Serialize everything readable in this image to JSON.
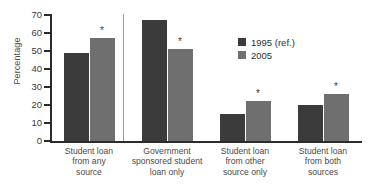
{
  "chart_data": {
    "type": "bar",
    "title": "",
    "xlabel": "",
    "ylabel": "Percentage",
    "ylim": [
      0,
      70
    ],
    "ytick_step": 10,
    "yticks": [
      70,
      60,
      50,
      40,
      30,
      20,
      10,
      0
    ],
    "grid": false,
    "legend_position": "top-right",
    "categories": [
      "Student loan from any source",
      "Government sponsored student loan only",
      "Student loan from other source only",
      "Student loan from both sources"
    ],
    "category_lines": [
      [
        "Student loan",
        "from any",
        "source"
      ],
      [
        "Government",
        "sponsored student",
        "loan only"
      ],
      [
        "Student loan",
        "from other",
        "source only"
      ],
      [
        "Student loan",
        "from both",
        "sources"
      ]
    ],
    "series": [
      {
        "name": "1995 (ref.)",
        "color": "#3b3b3b",
        "values": [
          49,
          67,
          15,
          20
        ],
        "significance": [
          false,
          false,
          false,
          false
        ]
      },
      {
        "name": "2005",
        "color": "#6f6f6f",
        "values": [
          57,
          51,
          22,
          26
        ],
        "significance": [
          true,
          true,
          true,
          true
        ]
      }
    ],
    "significance_marker": "*",
    "annotations": [
      "* indicates statistically significant difference from 1995 reference"
    ]
  },
  "legend": {
    "entries": [
      {
        "label": "1995 (ref.)",
        "color": "#3b3b3b"
      },
      {
        "label": "2005",
        "color": "#6f6f6f"
      }
    ]
  },
  "axis": {
    "y_title": "Percentage",
    "y_tick_labels": [
      "70",
      "60",
      "50",
      "40",
      "30",
      "20",
      "10",
      "0"
    ]
  }
}
